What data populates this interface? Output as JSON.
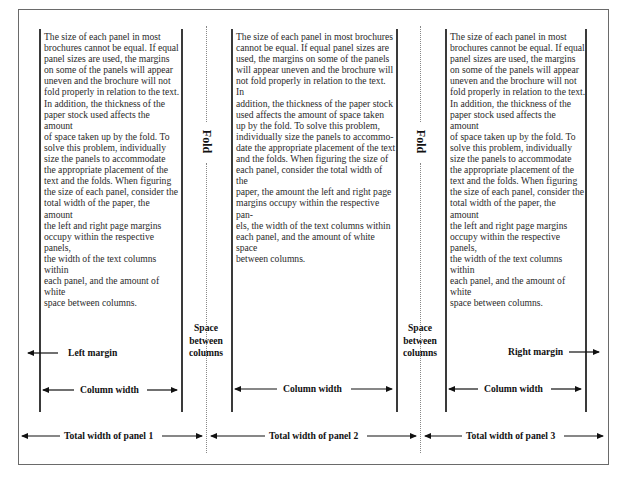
{
  "diagram": {
    "panels": [
      {
        "text": "The size of each panel in most\nbrochures cannot be equal. If equal\npanel sizes are used, the margins\non some of the panels will appear\nuneven and the brochure will not\nfold properly in relation to the text.\nIn addition, the thickness of the\npaper stock used affects the amount\nof space taken up by the fold. To\nsolve this problem, individually\nsize the panels to accommodate\nthe appropriate placement of the\ntext and the folds. When figuring\nthe size of each panel, consider the\ntotal width of the paper, the amount\nthe left and right page margins\noccupy within the respective panels,\nthe width of the text columns within\neach panel, and the amount of white\nspace between columns.",
        "column_width_label": "Column width",
        "total_width_label": "Total width of panel 1"
      },
      {
        "text": "The size of each panel in most brochures\ncannot be equal. If equal panel sizes are\nused, the margins on some of the panels\nwill appear uneven and the brochure will\nnot fold properly in relation to the text. In\naddition, the thickness of the paper stock\nused affects the amount of space taken\nup by the fold. To solve this problem,\nindividually size the panels to accommo-\ndate the appropriate placement of the text\nand the folds. When figuring the size of\neach panel, consider the total width of the\npaper, the amount the left and right page\nmargins occupy within the respective pan-\nels, the width of the text columns within\neach panel, and the amount of white space\nbetween columns.",
        "column_width_label": "Column width",
        "total_width_label": "Total width of panel 2"
      },
      {
        "text": "The size of each panel in most\nbrochures cannot be equal. If equal\npanel sizes are used, the margins\non some of the panels will appear\nuneven and the brochure will not\nfold properly in relation to the text.\nIn addition, the thickness of the\npaper stock used affects the amount\nof space taken up by the fold. To\nsolve this problem, individually\nsize the panels to accommodate\nthe appropriate placement of the\ntext and the folds. When figuring\nthe size of each panel, consider the\ntotal width of the paper, the amount\nthe left and right page margins\noccupy within the respective panels,\nthe width of the text columns within\neach panel, and the amount of white\nspace between columns.",
        "column_width_label": "Column width",
        "total_width_label": "Total width of panel 3"
      }
    ],
    "fold_label": "Fold",
    "space_between_columns_label": "Space\nbetween\ncolumns",
    "left_margin_label": "Left margin",
    "right_margin_label": "Right margin"
  }
}
